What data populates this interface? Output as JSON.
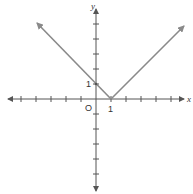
{
  "diagram": {
    "type": "function-graph",
    "function": "y = |x - 1|",
    "axis_labels": {
      "x": "x",
      "y": "y"
    },
    "origin_label": "O",
    "tick_labels": {
      "x_one": "1",
      "y_one": "1"
    },
    "colors": {
      "axis": "#555555",
      "graph": "#8a8a8a",
      "text": "#333333"
    },
    "vertex": [
      1,
      0
    ],
    "y_intercept": [
      0,
      1
    ]
  }
}
